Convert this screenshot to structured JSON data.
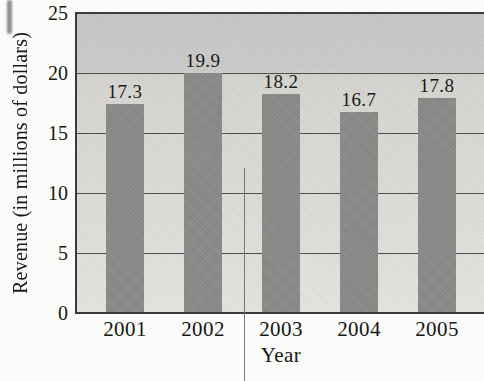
{
  "chart_data": {
    "type": "bar",
    "title": "",
    "categories": [
      "2001",
      "2002",
      "2003",
      "2004",
      "2005"
    ],
    "values": [
      17.3,
      19.9,
      18.2,
      16.7,
      17.8
    ],
    "value_labels": [
      "17.3",
      "19.9",
      "18.2",
      "16.7",
      "17.8"
    ],
    "xlabel": "Year",
    "ylabel": "Revenue (in millions of dollars)",
    "ylim": [
      0,
      25
    ],
    "yticks": [
      0,
      5,
      10,
      15,
      20,
      25
    ],
    "ytick_labels": [
      "0",
      "5",
      "10",
      "15",
      "20",
      "25"
    ],
    "grid": true,
    "legend": "none",
    "colors": {
      "bar": "#8e8d8b",
      "plot_background_top": "#c7c6c4",
      "plot_background_bottom": "#e4e3df",
      "gridline": "#4c4c4a",
      "axis": "#3b3b39",
      "text": "#161614",
      "page_background": "#fbfbf9"
    }
  }
}
